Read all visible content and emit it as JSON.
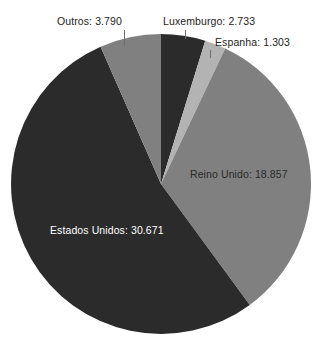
{
  "chart_data": {
    "type": "pie",
    "title": "",
    "subtitle": "",
    "xlabel": "",
    "ylabel": "",
    "legend_position": "none",
    "grid": false,
    "start_angle_deg": 0,
    "direction": "clockwise",
    "total": 57354,
    "categories": [
      "Luxemburgo",
      "Espanha",
      "Reino Unido",
      "Estados Unidos",
      "Outros"
    ],
    "values": [
      2733,
      1303,
      18857,
      30671,
      3790
    ],
    "value_labels": [
      "2.733",
      "1.303",
      "18.857",
      "30.671",
      "3.790"
    ],
    "colors": [
      "#2b2b2b",
      "#b3b3b3",
      "#808080",
      "#2b2b2b",
      "#808080"
    ],
    "slices": [
      {
        "name": "Luxemburgo",
        "label": "Luxemburgo: 2.733",
        "value": 2733,
        "value_text": "2.733",
        "color": "#2b2b2b",
        "start_deg": 0.0,
        "end_deg": 17.16,
        "label_placement": "outside"
      },
      {
        "name": "Espanha",
        "label": "Espanha: 1.303",
        "value": 1303,
        "value_text": "1.303",
        "color": "#b3b3b3",
        "start_deg": 17.16,
        "end_deg": 25.34,
        "label_placement": "outside"
      },
      {
        "name": "Reino Unido",
        "label": "Reino Unido: 18.857",
        "value": 18857,
        "value_text": "18.857",
        "color": "#808080",
        "start_deg": 25.34,
        "end_deg": 143.73,
        "label_placement": "inside"
      },
      {
        "name": "Estados Unidos",
        "label": "Estados Unidos: 30.671",
        "value": 30671,
        "value_text": "30.671",
        "color": "#2b2b2b",
        "start_deg": 143.73,
        "end_deg": 336.24,
        "label_placement": "inside"
      },
      {
        "name": "Outros",
        "label": "Outros: 3.790",
        "value": 3790,
        "value_text": "3.790",
        "color": "#808080",
        "start_deg": 336.24,
        "end_deg": 360.0,
        "label_placement": "outside"
      }
    ],
    "geometry": {
      "center_x": 161,
      "center_y": 184,
      "radius": 150
    },
    "background_color": "#ffffff",
    "label_text_color": "#232323",
    "inside_dark_text_color": "#ffffff"
  }
}
